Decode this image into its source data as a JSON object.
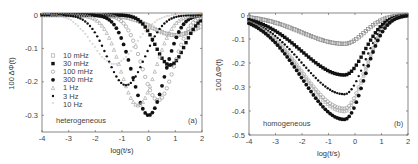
{
  "chart_data": [
    {
      "type": "scatter",
      "panel": "(a)",
      "annotation": "heterogeneous",
      "xlabel": "log(t/s)",
      "ylabel": "100 ΔΦ(t)",
      "xlim": [
        -4,
        2
      ],
      "ylim": [
        -0.35,
        0
      ],
      "xticks": [
        -4,
        -3,
        -2,
        -1,
        0,
        1,
        2
      ],
      "yticks": [
        0,
        -0.1,
        -0.2,
        -0.3
      ],
      "legend": [
        "10 mHz",
        "30 mHz",
        "100 mHz",
        "300 mHz",
        "1 Hz",
        "3 Hz",
        "10 Hz"
      ],
      "legend_position": "left-middle",
      "series": [
        {
          "name": "10 mHz",
          "marker": "open-square",
          "color": "#aaaaaa",
          "min_x": 1.0,
          "min_y": -0.06,
          "width": 0.9
        },
        {
          "name": "30 mHz",
          "marker": "filled-square",
          "color": "#111111",
          "min_x": 0.8,
          "min_y": -0.15,
          "width": 0.55
        },
        {
          "name": "100 mHz",
          "marker": "open-circle",
          "color": "#999999",
          "min_x": 0.35,
          "min_y": -0.255,
          "width": 0.6
        },
        {
          "name": "300 mHz",
          "marker": "filled-circle",
          "color": "#111111",
          "min_x": 0.0,
          "min_y": -0.3,
          "width": 0.6
        },
        {
          "name": "1 Hz",
          "marker": "open-triangle",
          "color": "#aaaaaa",
          "min_x": -0.4,
          "min_y": -0.27,
          "width": 0.65
        },
        {
          "name": "3 Hz",
          "marker": "filled-circle-small",
          "color": "#111111",
          "min_x": -0.85,
          "min_y": -0.21,
          "width": 0.7
        },
        {
          "name": "10 Hz",
          "marker": "star",
          "color": "#bbbbbb",
          "min_x": -1.3,
          "min_y": -0.15,
          "width": 0.8
        }
      ]
    },
    {
      "type": "scatter",
      "panel": "(b)",
      "annotation": "homogeneous",
      "xlabel": "log(t/s)",
      "ylabel": "100 ΔΦ(t)",
      "xlim": [
        -4,
        2
      ],
      "ylim": [
        -0.5,
        0
      ],
      "xticks": [
        -4,
        -3,
        -2,
        -1,
        0,
        1,
        2
      ],
      "yticks": [
        0,
        -0.1,
        -0.2,
        -0.3,
        -0.4,
        -0.5
      ],
      "series": [
        {
          "name": "10 mHz",
          "marker": "open-square",
          "color": "#888888",
          "min_x": -0.4,
          "min_y": -0.12
        },
        {
          "name": "30 mHz",
          "marker": "filled-square",
          "color": "#111111",
          "min_x": -0.4,
          "min_y": -0.25
        },
        {
          "name": "100 mHz",
          "marker": "filled-circle-small",
          "color": "#111111",
          "min_x": -0.4,
          "min_y": -0.33
        },
        {
          "name": "300 mHz",
          "marker": "open-circle",
          "color": "#999999",
          "min_x": -0.4,
          "min_y": -0.39
        },
        {
          "name": "1 Hz",
          "marker": "open-triangle",
          "color": "#aaaaaa",
          "min_x": -0.4,
          "min_y": -0.4
        },
        {
          "name": "3 Hz",
          "marker": "filled-circle",
          "color": "#111111",
          "min_x": -0.4,
          "min_y": -0.435
        }
      ]
    }
  ]
}
